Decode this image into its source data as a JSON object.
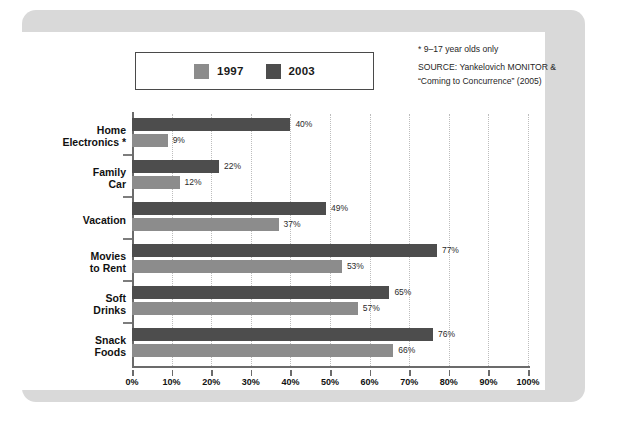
{
  "chart_data": {
    "type": "bar",
    "orientation": "horizontal",
    "title": "",
    "xlabel": "",
    "ylabel": "",
    "xlim": [
      0,
      100
    ],
    "xtick_labels": [
      "0%",
      "10%",
      "20%",
      "30%",
      "40%",
      "50%",
      "60%",
      "70%",
      "80%",
      "90%",
      "100%"
    ],
    "xtick_values": [
      0,
      10,
      20,
      30,
      40,
      50,
      60,
      70,
      80,
      90,
      100
    ],
    "grid": "vertical-dotted",
    "legend_position": "top-left",
    "categories": [
      "Home Electronics*",
      "Family Car",
      "Vacation",
      "Movies to Rent",
      "Soft Drinks",
      "Snack Foods"
    ],
    "series": [
      {
        "name": "2003",
        "color": "#4d4d4d",
        "values": [
          40,
          22,
          49,
          77,
          65,
          76
        ]
      },
      {
        "name": "1997",
        "color": "#8c8c8c",
        "values": [
          9,
          12,
          37,
          53,
          57,
          66
        ]
      }
    ],
    "value_labels": [
      {
        "category": "Home Electronics*",
        "2003": "40%",
        "1997": "9%"
      },
      {
        "category": "Family Car",
        "2003": "22%",
        "1997": "12%"
      },
      {
        "category": "Vacation",
        "2003": "49%",
        "1997": "37%"
      },
      {
        "category": "Movies to Rent",
        "2003": "77%",
        "1997": "53%"
      },
      {
        "category": "Soft Drinks",
        "2003": "65%",
        "1997": "57%"
      },
      {
        "category": "Snack Foods",
        "2003": "76%",
        "1997": "66%"
      }
    ]
  },
  "legend": {
    "entries": [
      {
        "label": "1997",
        "color": "#8c8c8c"
      },
      {
        "label": "2003",
        "color": "#4d4d4d"
      }
    ]
  },
  "source_note": {
    "footnote": "* 9–17 year olds only",
    "line1": "SOURCE: Yankelovich MONITOR &",
    "line2": "“Coming to Concurrence” (2005)"
  },
  "category_labels": [
    {
      "line1": "Home",
      "line2": "Electronics *"
    },
    {
      "line1": "Family",
      "line2": "Car"
    },
    {
      "line1": "Vacation",
      "line2": ""
    },
    {
      "line1": "Movies",
      "line2": "to Rent"
    },
    {
      "line1": "Soft",
      "line2": "Drinks"
    },
    {
      "line1": "Snack",
      "line2": "Foods"
    }
  ],
  "colors": {
    "panel_background": "#d9d9d9",
    "canvas_background": "#ffffff",
    "axis": "#6b6b6b",
    "gridline": "#bdbdbd",
    "series_1997": "#8c8c8c",
    "series_2003": "#4d4d4d"
  }
}
